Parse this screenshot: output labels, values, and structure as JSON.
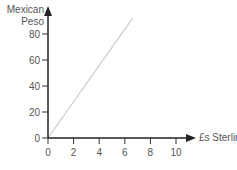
{
  "chart_data": {
    "type": "line",
    "title": "",
    "xlabel": "£s Sterling",
    "ylabel": "Mexican Peso",
    "ylabel_lines": [
      "Mexican",
      "Peso"
    ],
    "x_ticks": [
      0,
      2,
      4,
      6,
      8,
      10
    ],
    "y_ticks": [
      0,
      20,
      40,
      60,
      80
    ],
    "xlim": [
      0,
      11
    ],
    "ylim": [
      0,
      95
    ],
    "grid": false,
    "legend": null,
    "series": [
      {
        "name": "Exchange rate",
        "color": "#cccccc",
        "x": [
          0,
          6.6
        ],
        "y": [
          0,
          92
        ]
      }
    ]
  }
}
